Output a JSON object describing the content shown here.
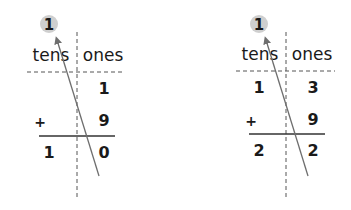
{
  "problems": [
    {
      "carry": "1",
      "headers": {
        "tens": "tens",
        "ones": "ones"
      },
      "addend1": {
        "tens": "",
        "ones": "1"
      },
      "operator": "+",
      "addend2": {
        "tens": "",
        "ones": "9"
      },
      "sum": {
        "tens": "1",
        "ones": "0"
      }
    },
    {
      "carry": "1",
      "headers": {
        "tens": "tens",
        "ones": "ones"
      },
      "addend1": {
        "tens": "1",
        "ones": "3"
      },
      "operator": "+",
      "addend2": {
        "tens": "",
        "ones": "9"
      },
      "sum": {
        "tens": "2",
        "ones": "2"
      }
    }
  ],
  "colors": {
    "carry_circle": "#cfcfcf",
    "arrow": "#6e6e6e",
    "dashed_line": "#555555",
    "rule_line": "#333333",
    "text": "#1a1a1a"
  }
}
